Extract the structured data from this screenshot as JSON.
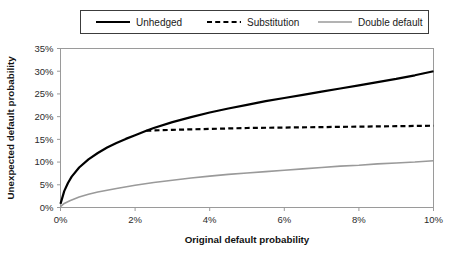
{
  "chart_data": {
    "type": "line",
    "title": "",
    "xlabel": "Original default probability",
    "ylabel": "Unexpected default probability",
    "xlim": [
      0,
      10
    ],
    "ylim": [
      0,
      35
    ],
    "x_unit": "%",
    "y_unit": "%",
    "grid": false,
    "legend_position": "top",
    "xticks": [
      0,
      2,
      4,
      6,
      8,
      10
    ],
    "xtick_labels": [
      "0%",
      "2%",
      "4%",
      "6%",
      "8%",
      "10%"
    ],
    "yticks": [
      0,
      5,
      10,
      15,
      20,
      25,
      30,
      35
    ],
    "ytick_labels": [
      "0%",
      "5%",
      "10%",
      "15%",
      "20%",
      "25%",
      "30%",
      "35%"
    ],
    "annotations": [
      {
        "text": "Substitution branches off the Unhedged curve at about 2.3% and stays flat at about 18%",
        "x": 2.3,
        "y": 18.0
      }
    ],
    "series": [
      {
        "name": "Unhedged",
        "style": "solid",
        "color": "#000000",
        "width": 2.2,
        "x": [
          0,
          0.1,
          0.2,
          0.3,
          0.5,
          0.75,
          1.0,
          1.25,
          1.5,
          1.75,
          2.0,
          2.3,
          2.5,
          3.0,
          3.5,
          4.0,
          4.5,
          5.0,
          5.5,
          6.0,
          6.5,
          7.0,
          7.5,
          8.0,
          8.5,
          9.0,
          9.5,
          10.0
        ],
        "y": [
          0.8,
          3.6,
          5.4,
          6.8,
          8.8,
          10.6,
          12.0,
          13.2,
          14.2,
          15.1,
          15.9,
          16.9,
          17.5,
          18.8,
          19.9,
          20.9,
          21.8,
          22.6,
          23.4,
          24.1,
          24.8,
          25.5,
          26.2,
          26.9,
          27.6,
          28.3,
          29.1,
          30.0
        ]
      },
      {
        "name": "Substitution",
        "style": "dashed",
        "color": "#000000",
        "width": 2.2,
        "x": [
          2.3,
          3.0,
          4.0,
          5.0,
          6.0,
          7.0,
          8.0,
          9.0,
          10.0
        ],
        "y": [
          16.9,
          17.1,
          17.3,
          17.5,
          17.6,
          17.7,
          17.8,
          17.9,
          18.0
        ]
      },
      {
        "name": "Double default",
        "style": "solid",
        "color": "#9a9a9a",
        "width": 1.6,
        "x": [
          0,
          0.1,
          0.25,
          0.5,
          0.75,
          1.0,
          1.5,
          2.0,
          2.5,
          3.0,
          3.5,
          4.0,
          4.5,
          5.0,
          5.5,
          6.0,
          6.5,
          7.0,
          7.5,
          8.0,
          8.5,
          9.0,
          9.5,
          10.0
        ],
        "y": [
          0.2,
          0.9,
          1.5,
          2.3,
          2.9,
          3.4,
          4.2,
          4.9,
          5.5,
          6.0,
          6.5,
          6.9,
          7.3,
          7.6,
          7.9,
          8.2,
          8.5,
          8.8,
          9.1,
          9.3,
          9.6,
          9.8,
          10.0,
          10.3
        ]
      }
    ],
    "legend": [
      {
        "label": "Unhedged",
        "style": "solid",
        "color": "#000000"
      },
      {
        "label": "Substitution",
        "style": "dashed",
        "color": "#000000"
      },
      {
        "label": "Double default",
        "style": "solid",
        "color": "#9a9a9a"
      }
    ]
  }
}
